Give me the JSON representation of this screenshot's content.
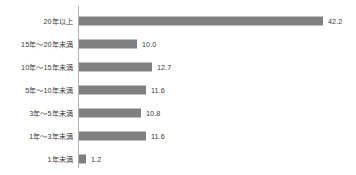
{
  "chart_data": {
    "type": "bar",
    "orientation": "horizontal",
    "title": "",
    "subtitle": "",
    "xlabel": "",
    "ylabel": "",
    "grid": false,
    "legend": false,
    "axis_line": true,
    "bar_color": "#808080",
    "text_color": "#3a3a3a",
    "axis_color": "#b0b0b0",
    "background": "#ffffff",
    "xlim": [
      0,
      48
    ],
    "px_per_unit": 5.78,
    "categories": [
      "20年以上",
      "15年～20年未満",
      "10年～15年未満",
      "5年～10年未満",
      "3年～5年未満",
      "1年～3年未満",
      "1年未満"
    ],
    "values": [
      42.2,
      10.0,
      12.7,
      11.6,
      10.8,
      11.6,
      1.2
    ],
    "value_labels": [
      "42.2",
      "10.0",
      "12.7",
      "11.6",
      "10.8",
      "11.6",
      "1.2"
    ]
  },
  "rows": [
    {
      "label": "20年以上",
      "value": 42.2,
      "value_label": "42.2"
    },
    {
      "label": "15年～20年未満",
      "value": 10.0,
      "value_label": "10.0"
    },
    {
      "label": "10年～15年未満",
      "value": 12.7,
      "value_label": "12.7"
    },
    {
      "label": "5年～10年未満",
      "value": 11.6,
      "value_label": "11.6"
    },
    {
      "label": "3年～5年未満",
      "value": 10.8,
      "value_label": "10.8"
    },
    {
      "label": "1年～3年未満",
      "value": 11.6,
      "value_label": "11.6"
    },
    {
      "label": "1年未満",
      "value": 1.2,
      "value_label": "1.2"
    }
  ]
}
